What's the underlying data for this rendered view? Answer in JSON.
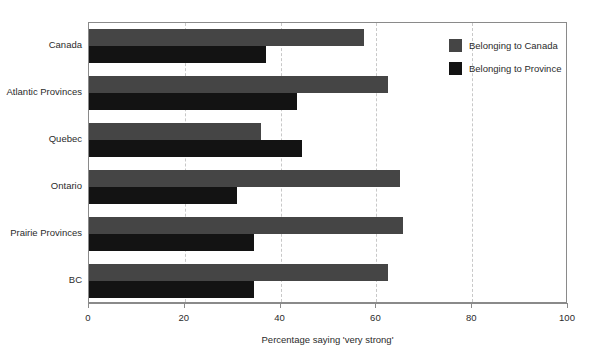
{
  "chart_data": {
    "type": "bar",
    "orientation": "horizontal",
    "title": "",
    "xlabel": "Percentage saying 'very strong'",
    "ylabel": "",
    "xlim": [
      0,
      100
    ],
    "xticks": [
      0,
      20,
      40,
      60,
      80,
      100
    ],
    "xtick_labels": [
      "0",
      "20",
      "40",
      "60",
      "80",
      "100"
    ],
    "grid": "x-dashed",
    "legend_position": "top-right-inside",
    "categories": [
      "Canada",
      "Atlantic Provinces",
      "Quebec",
      "Ontario",
      "Prairie Provinces",
      "BC"
    ],
    "series": [
      {
        "name": "Belonging to Canada",
        "color": "#454545",
        "values": [
          57.5,
          62.5,
          36.0,
          65.0,
          65.5,
          62.5
        ]
      },
      {
        "name": "Belonging to Province",
        "color": "#131313",
        "values": [
          37.0,
          43.5,
          44.5,
          31.0,
          34.5,
          34.5
        ]
      }
    ]
  },
  "legend": {
    "items": [
      {
        "label": "Belonging to Canada",
        "color": "#454545"
      },
      {
        "label": "Belonging to Province",
        "color": "#131313"
      }
    ]
  },
  "axis": {
    "x_title": "Percentage saying 'very strong'",
    "tick_labels": [
      "0",
      "20",
      "40",
      "60",
      "80",
      "100"
    ]
  },
  "colors": {
    "series_canada": "#454545",
    "series_province": "#131313",
    "frame": "#8a8a8a",
    "gridline": "#c8c8c8",
    "text": "#2b2b2b",
    "background": "#ffffff"
  }
}
